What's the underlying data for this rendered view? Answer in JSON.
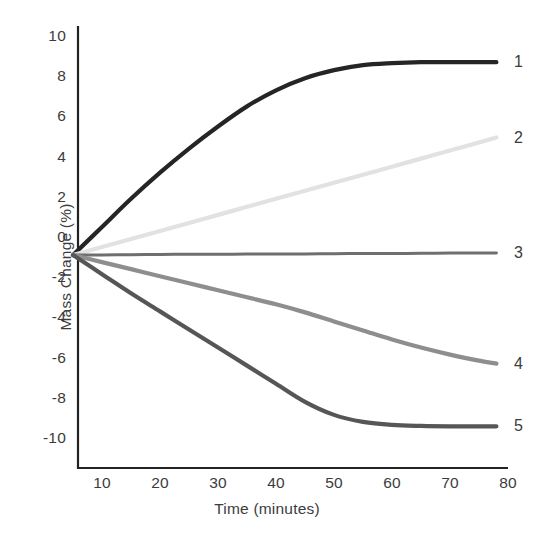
{
  "chart_data": {
    "type": "line",
    "title": "",
    "xlabel": "Time (minutes)",
    "ylabel": "Mass Change (%)",
    "xlim": [
      5,
      80
    ],
    "ylim": [
      -11,
      11
    ],
    "xticks": [
      "10",
      "20",
      "30",
      "40",
      "50",
      "60",
      "70",
      "80"
    ],
    "xtick_values": [
      10,
      20,
      30,
      40,
      50,
      60,
      70,
      80
    ],
    "yticks": [
      "10",
      "8",
      "6",
      "4",
      "2",
      "0",
      "-2",
      "-4",
      "-6",
      "-8",
      "-10"
    ],
    "ytick_values": [
      10,
      8,
      6,
      4,
      2,
      0,
      -2,
      -4,
      -6,
      -8,
      -10
    ],
    "grid": false,
    "legend_position": "right-inline-end-labels",
    "x": [
      5,
      10,
      15,
      20,
      25,
      30,
      35,
      40,
      45,
      50,
      55,
      60,
      65,
      70,
      75,
      78
    ],
    "series": [
      {
        "name": "1",
        "label": "1",
        "color": "#252525",
        "width": 4.2,
        "values": [
          -0.9,
          0.5,
          1.9,
          3.2,
          4.4,
          5.5,
          6.5,
          7.3,
          7.9,
          8.3,
          8.55,
          8.65,
          8.7,
          8.7,
          8.7,
          8.7
        ]
      },
      {
        "name": "2",
        "label": "2",
        "color": "#e2e2e2",
        "width": 4.2,
        "values": [
          -0.9,
          -0.5,
          -0.1,
          0.3,
          0.7,
          1.1,
          1.5,
          1.9,
          2.3,
          2.7,
          3.1,
          3.5,
          3.9,
          4.3,
          4.7,
          4.95
        ]
      },
      {
        "name": "3",
        "label": "3",
        "color": "#6f6f6f",
        "width": 3.0,
        "values": [
          -0.9,
          -0.89,
          -0.88,
          -0.87,
          -0.86,
          -0.86,
          -0.85,
          -0.84,
          -0.84,
          -0.83,
          -0.82,
          -0.82,
          -0.81,
          -0.8,
          -0.8,
          -0.79
        ]
      },
      {
        "name": "4",
        "label": "4",
        "color": "#8e8e8e",
        "width": 4.2,
        "values": [
          -0.9,
          -1.25,
          -1.6,
          -1.95,
          -2.3,
          -2.65,
          -3.0,
          -3.35,
          -3.75,
          -4.2,
          -4.65,
          -5.1,
          -5.5,
          -5.85,
          -6.15,
          -6.3
        ]
      },
      {
        "name": "5",
        "label": "5",
        "color": "#565656",
        "width": 4.2,
        "values": [
          -0.9,
          -1.85,
          -2.8,
          -3.7,
          -4.6,
          -5.5,
          -6.4,
          -7.3,
          -8.2,
          -8.85,
          -9.2,
          -9.35,
          -9.4,
          -9.42,
          -9.42,
          -9.42
        ]
      }
    ],
    "label_positions": [
      {
        "label": "1",
        "y": 8.7
      },
      {
        "label": "2",
        "y": 4.95
      },
      {
        "label": "3",
        "y": -0.79
      },
      {
        "label": "4",
        "y": -6.3
      },
      {
        "label": "5",
        "y": -9.42
      }
    ],
    "axis_color": "#222222"
  }
}
